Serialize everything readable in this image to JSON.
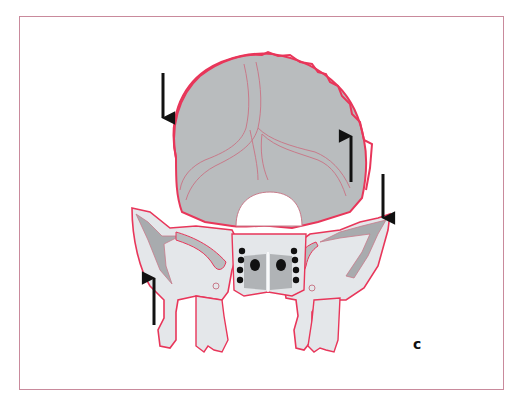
{
  "figure": {
    "panel_label": "c",
    "colors": {
      "outline": "#e8365a",
      "fill_dark": "#b9bcbe",
      "fill_light": "#e4e7ea",
      "inner_line": "#c87a8a",
      "arrow": "#111111",
      "frame": "#c98a9c"
    },
    "arrows": [
      {
        "id": "arrow-1",
        "direction": "down",
        "x": 163,
        "y1": 73,
        "y2": 118
      },
      {
        "id": "arrow-2",
        "direction": "up",
        "x": 351,
        "y1": 182,
        "y2": 136
      },
      {
        "id": "arrow-3",
        "direction": "down",
        "x": 383,
        "y1": 174,
        "y2": 218
      },
      {
        "id": "arrow-4",
        "direction": "up",
        "x": 154,
        "y1": 325,
        "y2": 278
      }
    ]
  }
}
